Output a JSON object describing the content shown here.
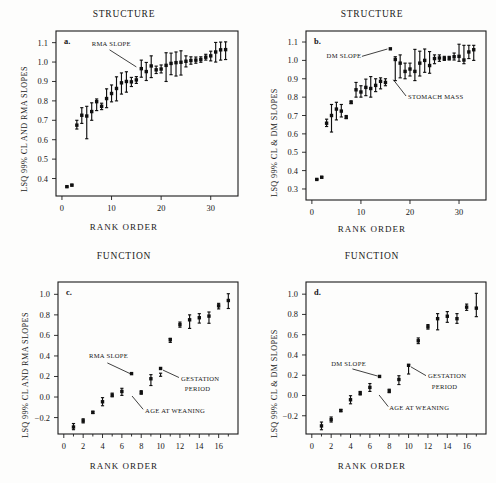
{
  "figure": {
    "width": 496,
    "height": 483,
    "background": "#fdfdfc",
    "ink_color": "#101010"
  },
  "panels": [
    {
      "letter": "a.",
      "title": "STRUCTURE",
      "xlabel": "RANK ORDER",
      "ylabel": "LSQ 99% CL AND RMA SLOPES"
    },
    {
      "letter": "b.",
      "title": "STRUCTURE",
      "xlabel": "RANK ORDER",
      "ylabel": "LSQ 99% CL  &  DM SLOPES"
    },
    {
      "letter": "c.",
      "title": "FUNCTION",
      "xlabel": "RANK ORDER",
      "ylabel": "LSQ 99% CL AND RMA SLOPES"
    },
    {
      "letter": "d.",
      "title": "FUNCTION",
      "xlabel": "RANK ORDER",
      "ylabel": "LSQ 99% CL  &  DM SLOPES"
    }
  ],
  "chart_data": [
    {
      "panel": "a",
      "type": "scatter",
      "title": "STRUCTURE",
      "xlabel": "RANK ORDER",
      "ylabel": "LSQ 99% CL AND RMA SLOPES",
      "xlim": [
        -1.2,
        35.5
      ],
      "ylim": [
        0.31,
        1.16
      ],
      "xticks": [
        0,
        10,
        20,
        30
      ],
      "yticks": [
        0.4,
        0.5,
        0.6,
        0.7,
        0.8,
        0.9,
        1.0,
        1.1
      ],
      "ytick_labels": [
        "0.4",
        "0.5",
        "0.6",
        "0.7",
        "0.8",
        "0.9",
        "1.0",
        "1.1"
      ],
      "grid": false,
      "legend": false,
      "annotations": [
        {
          "text": "RMA  SLOPE",
          "text_x": 6.0,
          "text_y": 1.082,
          "leader_from_x": 9.6,
          "leader_from_y": 1.063,
          "leader_to_x": 15.0,
          "leader_to_y": 0.975
        }
      ],
      "x": [
        1,
        2,
        3,
        4,
        5,
        6,
        7,
        8,
        9,
        10,
        11,
        12,
        13,
        14,
        15,
        16,
        17,
        18,
        19,
        20,
        21,
        22,
        23,
        24,
        25,
        26,
        27,
        28,
        29,
        30,
        31,
        32,
        33
      ],
      "y": [
        0.358,
        0.366,
        0.675,
        0.726,
        0.722,
        0.745,
        0.796,
        0.772,
        0.812,
        0.838,
        0.864,
        0.893,
        0.9,
        0.898,
        0.908,
        0.966,
        0.951,
        0.98,
        0.96,
        0.964,
        0.983,
        0.993,
        0.997,
        0.999,
        1.004,
        1.008,
        1.01,
        1.013,
        1.025,
        1.032,
        1.052,
        1.063,
        1.064
      ],
      "yerr_low": [
        0.355,
        0.362,
        0.655,
        0.684,
        0.605,
        0.7,
        0.75,
        0.755,
        0.765,
        0.795,
        0.8,
        0.835,
        0.845,
        0.874,
        0.89,
        0.922,
        0.905,
        0.92,
        0.941,
        0.944,
        0.9,
        0.935,
        0.928,
        0.933,
        0.975,
        0.989,
        0.994,
        0.999,
        1.01,
        1.006,
        1.0,
        1.01,
        1.013
      ],
      "yerr_high": [
        0.361,
        0.37,
        0.7,
        0.765,
        0.772,
        0.79,
        0.81,
        0.788,
        0.862,
        0.882,
        0.924,
        0.944,
        0.95,
        0.921,
        0.925,
        1.01,
        0.998,
        1.032,
        0.979,
        0.985,
        1.048,
        1.046,
        1.052,
        1.058,
        1.032,
        1.027,
        1.026,
        1.027,
        1.04,
        1.056,
        1.101,
        1.103,
        1.104
      ]
    },
    {
      "panel": "b",
      "type": "scatter",
      "title": "STRUCTURE",
      "xlabel": "RANK ORDER",
      "ylabel": "LSQ 99% CL  &  DM SLOPES",
      "xlim": [
        -1.2,
        35.5
      ],
      "ylim": [
        0.24,
        1.16
      ],
      "xticks": [
        0,
        10,
        20,
        30
      ],
      "yticks": [
        0.3,
        0.4,
        0.5,
        0.6,
        0.7,
        0.8,
        0.9,
        1.0,
        1.1
      ],
      "ytick_labels": [
        "0.3",
        "0.4",
        "0.5",
        "0.6",
        "0.7",
        "0.8",
        "0.9",
        "1.0",
        "1.1"
      ],
      "grid": false,
      "legend": false,
      "annotations": [
        {
          "text": "DM  SLOPE",
          "text_x": 3.0,
          "text_y": 1.012,
          "leader_from_x": 10.2,
          "leader_from_y": 1.022,
          "leader_to_x": 15.4,
          "leader_to_y": 1.062
        },
        {
          "text": "STOMACH MASS",
          "text_x": 19.6,
          "text_y": 0.79,
          "leader_from_x": 19.2,
          "leader_from_y": 0.806,
          "leader_to_x": 16.6,
          "leader_to_y": 0.895
        }
      ],
      "x": [
        1,
        2,
        3,
        4,
        5,
        6,
        7,
        8,
        9,
        10,
        11,
        12,
        13,
        14,
        15,
        16,
        17,
        18,
        19,
        20,
        21,
        22,
        23,
        24,
        25,
        26,
        27,
        28,
        29,
        30,
        31,
        32,
        33
      ],
      "y": [
        0.352,
        0.364,
        0.658,
        0.7,
        0.735,
        0.724,
        0.69,
        0.771,
        0.84,
        0.828,
        0.853,
        0.847,
        0.864,
        0.886,
        0.88,
        1.063,
        1.005,
        0.985,
        0.94,
        0.953,
        0.94,
        0.985,
        1.0,
        0.972,
        1.01,
        1.013,
        1.01,
        1.012,
        1.02,
        1.022,
        1.002,
        1.046,
        1.058
      ],
      "yerr_low": [
        0.35,
        0.36,
        0.64,
        0.61,
        0.676,
        0.692,
        0.683,
        0.765,
        0.8,
        0.8,
        0.808,
        0.8,
        0.83,
        0.845,
        0.862,
        1.063,
        0.89,
        0.905,
        0.9,
        0.915,
        0.89,
        0.915,
        0.935,
        0.93,
        0.982,
        0.995,
        1.0,
        1.002,
        1.002,
        0.995,
        0.982,
        1.01,
        1.0
      ],
      "yerr_high": [
        0.355,
        0.368,
        0.68,
        0.76,
        0.772,
        0.76,
        0.7,
        0.78,
        0.88,
        0.862,
        0.898,
        0.912,
        0.9,
        0.905,
        0.9,
        1.063,
        1.02,
        1.03,
        0.985,
        0.985,
        1.06,
        1.05,
        1.062,
        1.048,
        1.03,
        1.03,
        1.022,
        1.022,
        1.04,
        1.088,
        1.082,
        1.082,
        1.082
      ]
    },
    {
      "panel": "c",
      "type": "scatter",
      "title": "FUNCTION",
      "xlabel": "RANK ORDER",
      "ylabel": "LSQ 99% CL AND RMA SLOPES",
      "xlim": [
        -0.6,
        18.0
      ],
      "ylim": [
        -0.36,
        1.12
      ],
      "xticks": [
        0,
        2,
        4,
        6,
        8,
        10,
        12,
        14,
        16
      ],
      "yticks": [
        -0.2,
        0.0,
        0.2,
        0.4,
        0.6,
        0.8,
        1.0
      ],
      "ytick_labels": [
        "−0.2",
        "0.0",
        "0.2",
        "0.4",
        "0.6",
        "0.8",
        "1.0"
      ],
      "grid": false,
      "legend": false,
      "annotations": [
        {
          "text": "RMA  SLOPE",
          "text_x": 2.6,
          "text_y": 0.38,
          "leader_from_x": 4.5,
          "leader_from_y": 0.332,
          "leader_to_x": 6.85,
          "leader_to_y": 0.228
        },
        {
          "text": "AGE AT WEANING",
          "text_x": 8.4,
          "text_y": -0.152,
          "leader_from_x": 8.2,
          "leader_from_y": -0.12,
          "leader_to_x": 7.05,
          "leader_to_y": 0.01
        },
        {
          "text": "GESTATION",
          "text_x": 12.1,
          "text_y": 0.16,
          "leader_from_x": 11.9,
          "leader_from_y": 0.19,
          "leader_to_x": 10.25,
          "leader_to_y": 0.262
        },
        {
          "text": "PERIOD",
          "text_x": 12.5,
          "text_y": 0.058,
          "leader_from_x": null,
          "leader_from_y": null,
          "leader_to_x": null,
          "leader_to_y": null
        }
      ],
      "x": [
        1,
        2,
        3,
        4,
        5,
        6,
        7,
        8,
        9,
        10,
        11,
        12,
        13,
        14,
        15,
        16,
        17
      ],
      "y": [
        -0.292,
        -0.232,
        -0.15,
        -0.046,
        0.018,
        0.054,
        0.228,
        0.042,
        0.178,
        0.278,
        0.558,
        0.705,
        0.752,
        0.772,
        0.788,
        0.888,
        0.94
      ],
      "yerr_low": [
        -0.318,
        -0.252,
        -0.16,
        -0.085,
        0.002,
        0.016,
        0.228,
        0.028,
        0.112,
        0.202,
        0.532,
        0.68,
        0.668,
        0.72,
        0.718,
        0.858,
        0.862
      ],
      "yerr_high": [
        -0.258,
        -0.212,
        -0.138,
        -0.006,
        0.038,
        0.085,
        0.228,
        0.062,
        0.218,
        0.232,
        0.572,
        0.73,
        0.8,
        0.812,
        0.828,
        0.912,
        1.006
      ]
    },
    {
      "panel": "d",
      "type": "scatter",
      "title": "FUNCTION",
      "xlabel": "RANK ORDER",
      "ylabel": "LSQ 99% CL  &  DM SLOPES",
      "xlim": [
        -0.6,
        18.0
      ],
      "ylim": [
        -0.38,
        1.12
      ],
      "xticks": [
        0,
        2,
        4,
        6,
        8,
        10,
        12,
        14,
        16
      ],
      "yticks": [
        -0.2,
        0.0,
        0.2,
        0.4,
        0.6,
        0.8,
        1.0
      ],
      "ytick_labels": [
        "−0.2",
        "0.0",
        "0.2",
        "0.4",
        "0.6",
        "0.8",
        "1.0"
      ],
      "grid": false,
      "legend": false,
      "annotations": [
        {
          "text": "DM  SLOPE",
          "text_x": 2.0,
          "text_y": 0.292,
          "leader_from_x": 4.2,
          "leader_from_y": 0.262,
          "leader_to_x": 6.8,
          "leader_to_y": 0.192
        },
        {
          "text": "AGE AT WEANING",
          "text_x": 8.0,
          "text_y": -0.142,
          "leader_from_x": 7.9,
          "leader_from_y": -0.11,
          "leader_to_x": 6.95,
          "leader_to_y": 0.005
        },
        {
          "text": "GESTATION",
          "text_x": 12.0,
          "text_y": 0.168,
          "leader_from_x": 11.8,
          "leader_from_y": 0.196,
          "leader_to_x": 10.25,
          "leader_to_y": 0.282
        },
        {
          "text": "PERIOD",
          "text_x": 12.4,
          "text_y": 0.068,
          "leader_from_x": null,
          "leader_from_y": null,
          "leader_to_x": null,
          "leader_to_y": null
        }
      ],
      "x": [
        1,
        2,
        3,
        4,
        5,
        6,
        7,
        8,
        9,
        10,
        11,
        12,
        13,
        14,
        15,
        16,
        17
      ],
      "y": [
        -0.3,
        -0.238,
        -0.148,
        -0.042,
        0.022,
        0.08,
        0.188,
        0.044,
        0.158,
        0.298,
        0.54,
        0.678,
        0.758,
        0.782,
        0.758,
        0.872,
        0.862
      ],
      "yerr_low": [
        -0.338,
        -0.262,
        -0.16,
        -0.082,
        0.005,
        0.04,
        0.188,
        0.028,
        0.108,
        0.212,
        0.512,
        0.655,
        0.648,
        0.722,
        0.712,
        0.84,
        0.778
      ],
      "yerr_high": [
        -0.262,
        -0.212,
        -0.138,
        -0.002,
        0.04,
        0.118,
        0.188,
        0.062,
        0.195,
        0.305,
        0.568,
        0.7,
        0.808,
        0.828,
        0.808,
        0.902,
        1.008
      ]
    }
  ]
}
